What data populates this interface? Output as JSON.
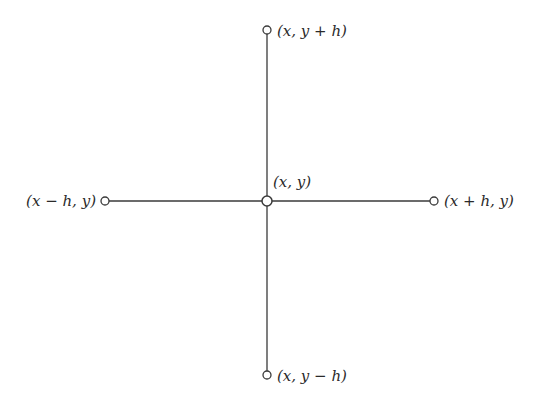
{
  "diagram": {
    "type": "five-point stencil",
    "line_color": "#3a3a3a",
    "node_fill": "#ffffff",
    "nodes": [
      {
        "id": "top",
        "label": "(x, y + h)",
        "cx": 267,
        "cy": 30
      },
      {
        "id": "left",
        "label": "(x − h, y)",
        "cx": 105,
        "cy": 201
      },
      {
        "id": "center",
        "label": "(x, y)",
        "cx": 267,
        "cy": 201
      },
      {
        "id": "right",
        "label": "(x + h, y)",
        "cx": 434,
        "cy": 201
      },
      {
        "id": "bottom",
        "label": "(x, y − h)",
        "cx": 267,
        "cy": 375
      }
    ],
    "edges": [
      {
        "from": "center",
        "to": "top"
      },
      {
        "from": "center",
        "to": "bottom"
      },
      {
        "from": "center",
        "to": "left"
      },
      {
        "from": "center",
        "to": "right"
      }
    ]
  }
}
